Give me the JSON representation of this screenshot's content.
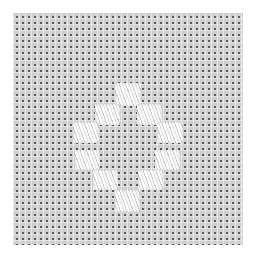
{
  "image": {
    "subject": "Hardanger-style satin-stitch kloster blocks on evenweave fabric",
    "fabric": {
      "color": "#cfcfcf",
      "weave_hole_color": "#5a5a5a",
      "bounds": {
        "x": 13,
        "y": 13,
        "w": 230,
        "h": 232
      }
    },
    "thread_color": "#f4f4f4",
    "motif": "diamond outline of 10 satin-stitch blocks",
    "stitch_blocks": [
      {
        "id": "top",
        "x": 115,
        "y": 83,
        "w": 26,
        "h": 23
      },
      {
        "id": "row2-left",
        "x": 95,
        "y": 104,
        "w": 25,
        "h": 21
      },
      {
        "id": "row2-right",
        "x": 137,
        "y": 104,
        "w": 25,
        "h": 21
      },
      {
        "id": "row3-left",
        "x": 73,
        "y": 122,
        "w": 26,
        "h": 21
      },
      {
        "id": "row3-right",
        "x": 157,
        "y": 122,
        "w": 26,
        "h": 21
      },
      {
        "id": "row4-left",
        "x": 75,
        "y": 150,
        "w": 25,
        "h": 20
      },
      {
        "id": "row4-right",
        "x": 155,
        "y": 150,
        "w": 25,
        "h": 20
      },
      {
        "id": "row5-left",
        "x": 93,
        "y": 170,
        "w": 25,
        "h": 20
      },
      {
        "id": "row5-right",
        "x": 138,
        "y": 170,
        "w": 25,
        "h": 20
      },
      {
        "id": "bottom",
        "x": 115,
        "y": 190,
        "w": 25,
        "h": 22
      }
    ]
  }
}
